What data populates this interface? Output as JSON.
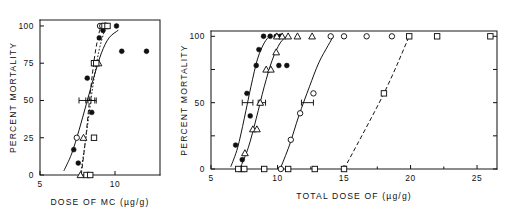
{
  "figure": {
    "background": "#ffffff",
    "ink_color": "#141414",
    "width": 509,
    "height": 218,
    "panel_count": 2
  },
  "chart_data": [
    {
      "id": "left-panel",
      "type": "scatter",
      "title": "",
      "xlabel": "DOSE OF MC  (µg/g)",
      "ylabel": "PERCENT MORTALITY",
      "xlim": [
        5,
        13
      ],
      "ylim": [
        0,
        104
      ],
      "grid": false,
      "legend": "none",
      "xticks": [
        5,
        10
      ],
      "xticklabels": [
        "5",
        "10"
      ],
      "xminorticks": [],
      "yticks": [
        0,
        25,
        50,
        75,
        100
      ],
      "yticklabels": [
        "0",
        "25",
        "50",
        "75",
        "100"
      ],
      "series": [
        {
          "name": "filled-circle-series",
          "marker": "filled-circle",
          "line": "solid",
          "points": [
            {
              "x": 7.25,
              "y": 17
            },
            {
              "x": 7.55,
              "y": 8
            },
            {
              "x": 8.15,
              "y": 65
            },
            {
              "x": 8.45,
              "y": 42
            },
            {
              "x": 8.95,
              "y": 92
            },
            {
              "x": 9.2,
              "y": 97
            },
            {
              "x": 10.1,
              "y": 100
            },
            {
              "x": 10.45,
              "y": 83
            },
            {
              "x": 12.1,
              "y": 83
            }
          ],
          "fit_curve": [
            {
              "x": 6.6,
              "y": 3
            },
            {
              "x": 7.1,
              "y": 14
            },
            {
              "x": 7.6,
              "y": 30
            },
            {
              "x": 8.1,
              "y": 48
            },
            {
              "x": 8.6,
              "y": 66
            },
            {
              "x": 9.1,
              "y": 82
            },
            {
              "x": 9.6,
              "y": 92
            },
            {
              "x": 10.2,
              "y": 97
            }
          ],
          "ed50": 8.1,
          "ed50_error_low": 7.6,
          "ed50_error_high": 8.4
        },
        {
          "name": "open-circle-series",
          "marker": "open-circle",
          "line": "dashed",
          "points": [
            {
              "x": 7.45,
              "y": 25
            },
            {
              "x": 9.0,
              "y": 100
            },
            {
              "x": 9.15,
              "y": 100
            }
          ],
          "fit_curve": [
            {
              "x": 7.75,
              "y": 0
            },
            {
              "x": 8.05,
              "y": 25
            },
            {
              "x": 8.35,
              "y": 55
            },
            {
              "x": 8.65,
              "y": 80
            },
            {
              "x": 8.95,
              "y": 96
            },
            {
              "x": 9.1,
              "y": 100
            }
          ],
          "ed50": 8.35,
          "ed50_error_low": 8.05,
          "ed50_error_high": 8.65
        },
        {
          "name": "open-triangle-series",
          "marker": "open-triangle",
          "line": "dotted",
          "points": [
            {
              "x": 7.7,
              "y": 0
            },
            {
              "x": 7.9,
              "y": 25
            },
            {
              "x": 8.9,
              "y": 75
            },
            {
              "x": 9.35,
              "y": 100
            }
          ],
          "fit_curve": [
            {
              "x": 7.7,
              "y": 0
            },
            {
              "x": 8.1,
              "y": 28
            },
            {
              "x": 8.5,
              "y": 58
            },
            {
              "x": 8.9,
              "y": 82
            },
            {
              "x": 9.3,
              "y": 97
            }
          ],
          "ed50": 8.5,
          "ed50_error_low": 8.2,
          "ed50_error_high": 8.75
        },
        {
          "name": "open-square-series",
          "marker": "open-square",
          "line": "none",
          "points": [
            {
              "x": 8.1,
              "y": 0
            },
            {
              "x": 8.35,
              "y": 0
            },
            {
              "x": 8.6,
              "y": 25
            },
            {
              "x": 8.6,
              "y": 75
            },
            {
              "x": 8.75,
              "y": 75
            },
            {
              "x": 9.3,
              "y": 100
            },
            {
              "x": 9.5,
              "y": 100
            }
          ],
          "fit_curve": [],
          "ed50": null,
          "ed50_error_low": null,
          "ed50_error_high": null
        }
      ]
    },
    {
      "id": "right-panel",
      "type": "scatter",
      "title": "",
      "xlabel": "TOTAL DOSE OF  (µg/g)",
      "ylabel": "PERCENT MORTALITY",
      "xlim": [
        5,
        26.5
      ],
      "ylim": [
        0,
        104
      ],
      "grid": false,
      "legend": "none",
      "xticks": [
        5,
        10,
        15,
        20,
        25
      ],
      "xticklabels": [
        "5",
        "10",
        "15",
        "20",
        "25"
      ],
      "xminorticks": [
        7.5,
        12.5,
        17.5,
        22.5
      ],
      "yticks": [
        0,
        25,
        50,
        75,
        100
      ],
      "yticklabels": [
        "0",
        "",
        "50",
        "",
        "100"
      ],
      "series": [
        {
          "name": "filled-circle-series",
          "marker": "filled-circle",
          "line": "solid",
          "points": [
            {
              "x": 6.85,
              "y": 18
            },
            {
              "x": 7.35,
              "y": 7
            },
            {
              "x": 7.7,
              "y": 57
            },
            {
              "x": 7.95,
              "y": 40
            },
            {
              "x": 8.4,
              "y": 78
            },
            {
              "x": 8.6,
              "y": 90
            },
            {
              "x": 8.95,
              "y": 100
            },
            {
              "x": 9.45,
              "y": 100
            },
            {
              "x": 9.9,
              "y": 100
            },
            {
              "x": 10.2,
              "y": 100
            },
            {
              "x": 10.1,
              "y": 78
            },
            {
              "x": 10.7,
              "y": 78
            }
          ],
          "fit_curve": [
            {
              "x": 6.5,
              "y": 2
            },
            {
              "x": 7.0,
              "y": 16
            },
            {
              "x": 7.5,
              "y": 38
            },
            {
              "x": 8.0,
              "y": 62
            },
            {
              "x": 8.5,
              "y": 83
            },
            {
              "x": 9.0,
              "y": 95
            },
            {
              "x": 9.4,
              "y": 100
            }
          ],
          "ed50": 7.8,
          "ed50_error_low": 7.35,
          "ed50_error_high": 8.15
        },
        {
          "name": "open-triangle-series",
          "marker": "open-triangle",
          "line": "solid",
          "points": [
            {
              "x": 7.3,
              "y": 0
            },
            {
              "x": 7.55,
              "y": 12
            },
            {
              "x": 8.15,
              "y": 30
            },
            {
              "x": 8.45,
              "y": 30
            },
            {
              "x": 8.7,
              "y": 50
            },
            {
              "x": 9.15,
              "y": 75
            },
            {
              "x": 9.5,
              "y": 75
            },
            {
              "x": 9.9,
              "y": 88
            },
            {
              "x": 9.95,
              "y": 100
            },
            {
              "x": 10.35,
              "y": 100
            },
            {
              "x": 10.8,
              "y": 100
            },
            {
              "x": 11.5,
              "y": 100
            },
            {
              "x": 12.6,
              "y": 100
            }
          ],
          "fit_curve": [
            {
              "x": 7.2,
              "y": 1
            },
            {
              "x": 7.8,
              "y": 16
            },
            {
              "x": 8.4,
              "y": 38
            },
            {
              "x": 9.0,
              "y": 62
            },
            {
              "x": 9.6,
              "y": 82
            },
            {
              "x": 10.2,
              "y": 95
            },
            {
              "x": 10.7,
              "y": 100
            }
          ],
          "ed50": 8.85,
          "ed50_error_low": 8.55,
          "ed50_error_high": 9.1
        },
        {
          "name": "open-circle-series",
          "marker": "open-circle",
          "line": "solid",
          "points": [
            {
              "x": 10.25,
              "y": 0
            },
            {
              "x": 11.0,
              "y": 22
            },
            {
              "x": 11.7,
              "y": 42
            },
            {
              "x": 12.7,
              "y": 57
            },
            {
              "x": 14.0,
              "y": 100
            },
            {
              "x": 15.0,
              "y": 100
            },
            {
              "x": 16.7,
              "y": 100
            },
            {
              "x": 18.6,
              "y": 100
            }
          ],
          "fit_curve": [
            {
              "x": 10.2,
              "y": 0
            },
            {
              "x": 10.9,
              "y": 18
            },
            {
              "x": 11.6,
              "y": 40
            },
            {
              "x": 12.4,
              "y": 62
            },
            {
              "x": 13.1,
              "y": 80
            },
            {
              "x": 13.8,
              "y": 93
            },
            {
              "x": 14.2,
              "y": 100
            }
          ],
          "ed50": 12.3,
          "ed50_error_low": 11.8,
          "ed50_error_high": 12.7
        },
        {
          "name": "open-square-series",
          "marker": "open-square",
          "line": "dashed",
          "points": [
            {
              "x": 7.05,
              "y": 0
            },
            {
              "x": 7.5,
              "y": 0
            },
            {
              "x": 9.0,
              "y": 0
            },
            {
              "x": 10.8,
              "y": 0
            },
            {
              "x": 12.8,
              "y": 0
            },
            {
              "x": 15.0,
              "y": 0
            },
            {
              "x": 18.0,
              "y": 57
            },
            {
              "x": 19.9,
              "y": 100
            },
            {
              "x": 22.0,
              "y": 100
            },
            {
              "x": 26.0,
              "y": 100
            }
          ],
          "fit_curve": [
            {
              "x": 15.0,
              "y": 0
            },
            {
              "x": 18.0,
              "y": 57
            },
            {
              "x": 19.9,
              "y": 100
            }
          ],
          "ed50": 17.8,
          "ed50_error_low": null,
          "ed50_error_high": null
        }
      ]
    }
  ]
}
